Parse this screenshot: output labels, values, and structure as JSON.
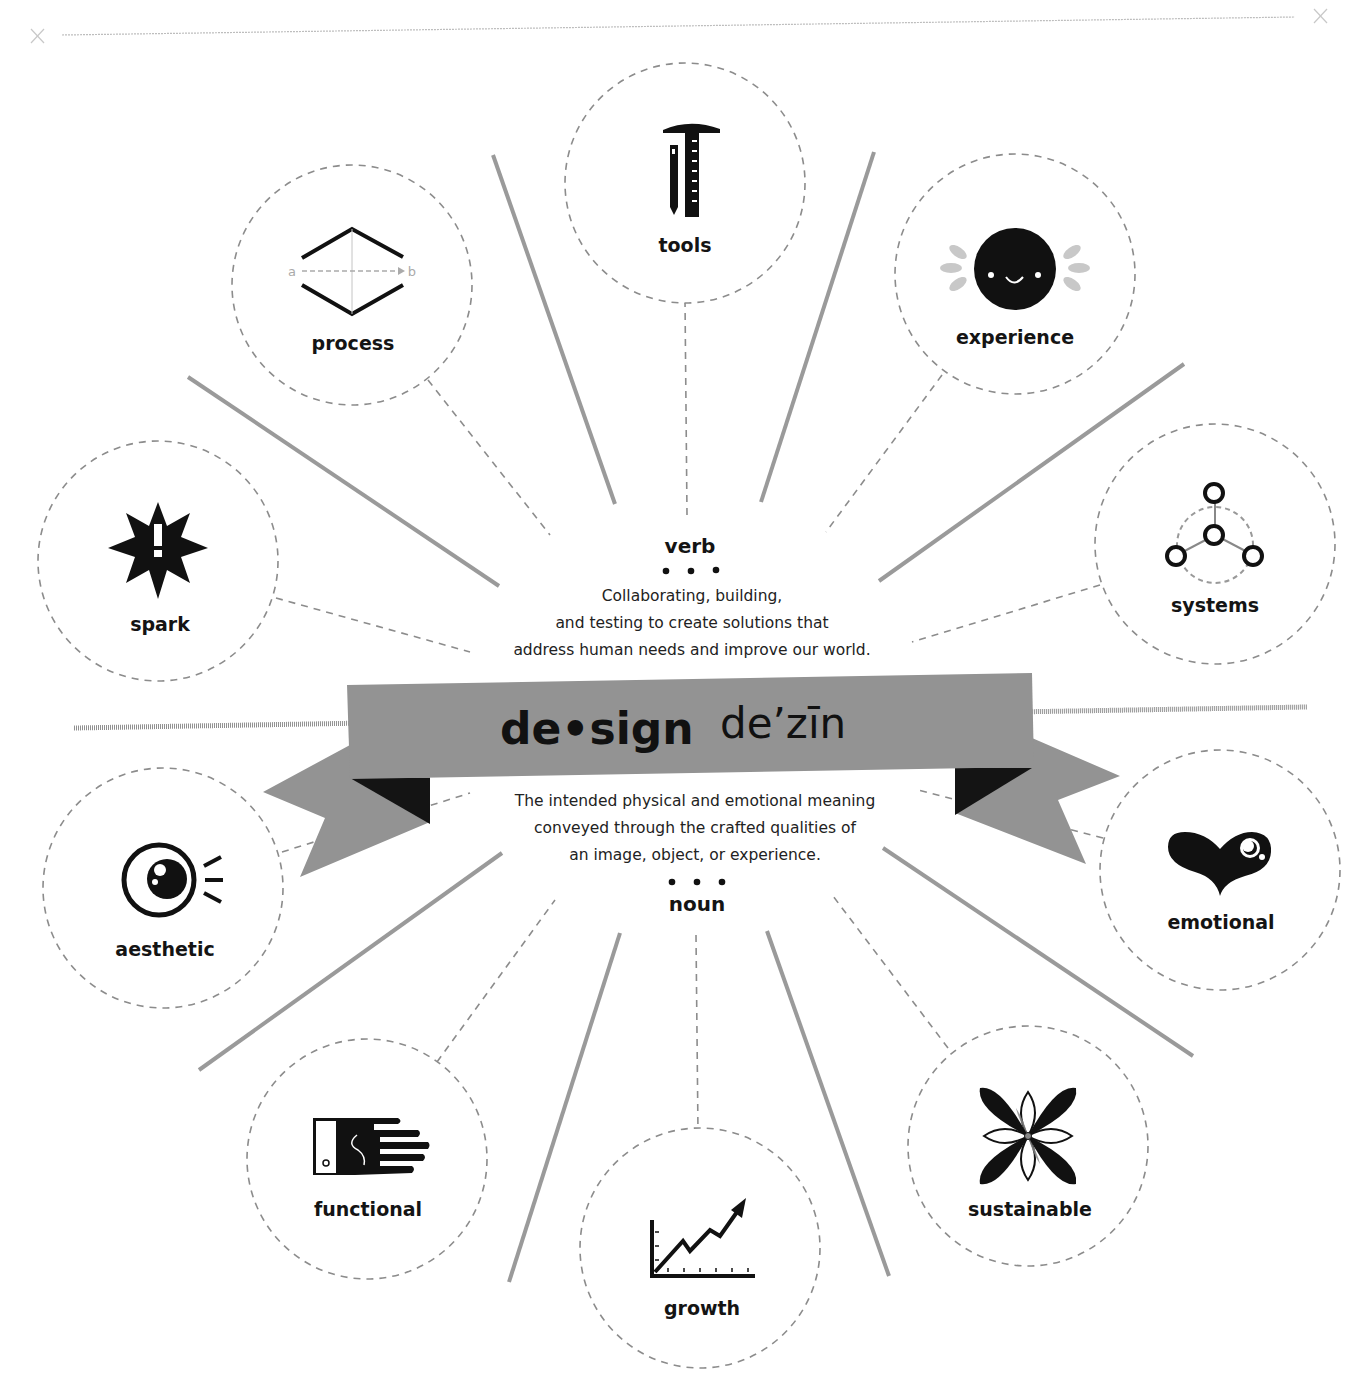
{
  "header": {
    "title_partial": "...y design",
    "rule_left_mark": "×",
    "rule_right_mark": "×"
  },
  "center": {
    "word": "de•sign",
    "pronunciation": "de’zīn",
    "verb": {
      "label": "verb",
      "bullets": "• • •",
      "lines": [
        "Collaborating, building,",
        "and testing to create solutions that",
        "address human needs and improve our world."
      ]
    },
    "noun": {
      "label": "noun",
      "bullets": "• • •",
      "lines": [
        "The intended physical and emotional meaning",
        "conveyed through the crafted qualities of",
        "an image, object, or experience."
      ]
    }
  },
  "nodes": [
    {
      "id": "tools",
      "label": "tools",
      "icon": "ruler-pencil-icon",
      "group": "verb"
    },
    {
      "id": "process",
      "label": "process",
      "icon": "a-to-b-diamond-icon",
      "group": "verb",
      "icon_text_a": "a",
      "icon_text_b": "b"
    },
    {
      "id": "experience",
      "label": "experience",
      "icon": "smiley-face-icon",
      "group": "verb"
    },
    {
      "id": "spark",
      "label": "spark",
      "icon": "starburst-exclamation-icon",
      "group": "verb"
    },
    {
      "id": "systems",
      "label": "systems",
      "icon": "connected-nodes-icon",
      "group": "verb"
    },
    {
      "id": "aesthetic",
      "label": "aesthetic",
      "icon": "eye-icon",
      "group": "noun"
    },
    {
      "id": "emotional",
      "label": "emotional",
      "icon": "heart-icon",
      "group": "noun"
    },
    {
      "id": "functional",
      "label": "functional",
      "icon": "hand-icon",
      "group": "noun"
    },
    {
      "id": "growth",
      "label": "growth",
      "icon": "rising-chart-icon",
      "group": "noun"
    },
    {
      "id": "sustainable",
      "label": "sustainable",
      "icon": "flower-icon",
      "group": "noun"
    }
  ],
  "colors": {
    "banner": "#939393",
    "banner_fold": "#141414",
    "ray": "#9a9a9a",
    "dash": "#8c8c8c",
    "ink": "#111111",
    "light_gray": "#c4c4c4"
  }
}
